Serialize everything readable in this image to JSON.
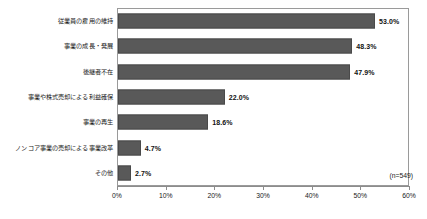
{
  "chart_data": {
    "type": "bar",
    "orientation": "horizontal",
    "title": "",
    "subtitle": "",
    "xlabel": "",
    "ylabel": "",
    "xlim": [
      0,
      60
    ],
    "grid": false,
    "legend": null,
    "annotation": "(n=549)",
    "tick_labels": [
      "0%",
      "10%",
      "20%",
      "30%",
      "40%",
      "50%",
      "60%"
    ],
    "tick_values": [
      0,
      10,
      20,
      30,
      40,
      50,
      60
    ],
    "bar_color": "#595959",
    "categories": [
      "従業員の雇用の維持",
      "事業の成長・発展",
      "後継者不在",
      "事業や株式売却による利益確保",
      "事業の再生",
      "ノンコア事業の売却による事業改革",
      "その他"
    ],
    "values": [
      53.0,
      48.3,
      47.9,
      22.0,
      18.6,
      4.7,
      2.7
    ],
    "value_labels": [
      "53.0%",
      "48.3%",
      "47.9%",
      "22.0%",
      "18.6%",
      "4.7%",
      "2.7%"
    ]
  }
}
